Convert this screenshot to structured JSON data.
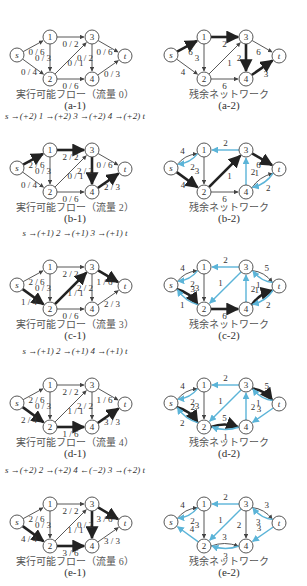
{
  "colors": {
    "normal": "#444444",
    "bold": "#222222",
    "reverse": "#5bb4d8"
  },
  "nodes": {
    "s": [
      17,
      43
    ],
    "1": [
      50,
      25
    ],
    "3": [
      92,
      25
    ],
    "t": [
      125,
      44
    ],
    "2": [
      50,
      67
    ],
    "4": [
      92,
      67
    ]
  },
  "rows": [
    {
      "top": 0,
      "left": {
        "subcaption": "(a-1)",
        "caption": "実行可能フロー（流量 0）",
        "augmenting_path": "",
        "edges": [
          {
            "from": "s",
            "to": "1",
            "label": "0 / 6",
            "style": "normal"
          },
          {
            "from": "s",
            "to": "2",
            "label": "0 / 4",
            "style": "normal"
          },
          {
            "from": "1",
            "to": "3",
            "label": "0 / 2",
            "style": "normal"
          },
          {
            "from": "1",
            "to": "2",
            "label": "0 / 3",
            "style": "normal"
          },
          {
            "from": "2",
            "to": "3",
            "label": "0 / 1",
            "style": "normal"
          },
          {
            "from": "2",
            "to": "4",
            "label": "0 / 6",
            "style": "normal"
          },
          {
            "from": "3",
            "to": "4",
            "label": "0 / 2",
            "style": "normal"
          },
          {
            "from": "3",
            "to": "t",
            "label": "0 / 6",
            "style": "normal"
          },
          {
            "from": "4",
            "to": "t",
            "label": "0 / 3",
            "style": "normal"
          }
        ]
      },
      "right": {
        "subcaption": "(a-2)",
        "caption": "残余ネットワーク",
        "edges": [
          {
            "from": "s",
            "to": "1",
            "label": "6",
            "style": "bold"
          },
          {
            "from": "s",
            "to": "2",
            "label": "4",
            "style": "normal"
          },
          {
            "from": "1",
            "to": "3",
            "label": "2",
            "style": "bold"
          },
          {
            "from": "1",
            "to": "2",
            "label": "3",
            "style": "normal"
          },
          {
            "from": "2",
            "to": "3",
            "label": "1",
            "style": "normal"
          },
          {
            "from": "2",
            "to": "4",
            "label": "6",
            "style": "normal"
          },
          {
            "from": "3",
            "to": "4",
            "label": "2",
            "style": "bold"
          },
          {
            "from": "3",
            "to": "t",
            "label": "6",
            "style": "normal"
          },
          {
            "from": "4",
            "to": "t",
            "label": "3",
            "style": "bold"
          }
        ]
      }
    },
    {
      "top": 113,
      "left": {
        "subcaption": "(b-1)",
        "caption": "実行可能フロー（流量 2）",
        "augmenting_path": "s →(+2) 1 →(+2) 3 →(+2) 4 →(+2) t",
        "edges": [
          {
            "from": "s",
            "to": "1",
            "label": "2 / 6",
            "style": "bold"
          },
          {
            "from": "s",
            "to": "2",
            "label": "0 / 4",
            "style": "normal"
          },
          {
            "from": "1",
            "to": "3",
            "label": "2 / 2",
            "style": "bold"
          },
          {
            "from": "1",
            "to": "2",
            "label": "0 / 3",
            "style": "normal"
          },
          {
            "from": "2",
            "to": "3",
            "label": "0 / 1",
            "style": "normal"
          },
          {
            "from": "2",
            "to": "4",
            "label": "0 / 6",
            "style": "normal"
          },
          {
            "from": "3",
            "to": "4",
            "label": "2 / 2",
            "style": "bold"
          },
          {
            "from": "3",
            "to": "t",
            "label": "0 / 6",
            "style": "normal"
          },
          {
            "from": "4",
            "to": "t",
            "label": "2 / 3",
            "style": "bold"
          }
        ]
      },
      "right": {
        "subcaption": "(b-2)",
        "caption": "残余ネットワーク",
        "edges": [
          {
            "from": "s",
            "to": "1",
            "label": "4",
            "style": "normal",
            "curve": -1
          },
          {
            "from": "1",
            "to": "s",
            "label": "2",
            "style": "reverse",
            "curve": -1
          },
          {
            "from": "s",
            "to": "2",
            "label": "4",
            "style": "bold"
          },
          {
            "from": "3",
            "to": "1",
            "label": "2",
            "style": "reverse"
          },
          {
            "from": "1",
            "to": "2",
            "label": "3",
            "style": "normal"
          },
          {
            "from": "2",
            "to": "3",
            "label": "1",
            "style": "bold"
          },
          {
            "from": "2",
            "to": "4",
            "label": "6",
            "style": "normal"
          },
          {
            "from": "4",
            "to": "3",
            "label": "2",
            "style": "reverse"
          },
          {
            "from": "3",
            "to": "t",
            "label": "6",
            "style": "bold"
          },
          {
            "from": "4",
            "to": "t",
            "label": "1",
            "style": "normal",
            "curve": -1
          },
          {
            "from": "t",
            "to": "4",
            "label": "2",
            "style": "reverse",
            "curve": -1
          }
        ]
      }
    },
    {
      "top": 230,
      "left": {
        "subcaption": "(c-1)",
        "caption": "実行可能フロー（流量 3）",
        "augmenting_path": "s →(+1) 2 →(+1) 3 →(+1) t",
        "edges": [
          {
            "from": "s",
            "to": "1",
            "label": "2 / 6",
            "style": "normal"
          },
          {
            "from": "s",
            "to": "2",
            "label": "1 / 4",
            "style": "bold"
          },
          {
            "from": "1",
            "to": "3",
            "label": "2 / 2",
            "style": "normal"
          },
          {
            "from": "1",
            "to": "2",
            "label": "0 / 3",
            "style": "normal"
          },
          {
            "from": "2",
            "to": "3",
            "label": "1 / 1",
            "style": "bold"
          },
          {
            "from": "2",
            "to": "4",
            "label": "0 / 6",
            "style": "normal"
          },
          {
            "from": "3",
            "to": "4",
            "label": "2 / 2",
            "style": "normal"
          },
          {
            "from": "3",
            "to": "t",
            "label": "1 / 6",
            "style": "bold"
          },
          {
            "from": "4",
            "to": "t",
            "label": "2 / 3",
            "style": "normal"
          }
        ]
      },
      "right": {
        "subcaption": "(c-2)",
        "caption": "残余ネットワーク",
        "edges": [
          {
            "from": "s",
            "to": "1",
            "label": "4",
            "style": "normal",
            "curve": -1
          },
          {
            "from": "1",
            "to": "s",
            "label": "2",
            "style": "reverse",
            "curve": -1
          },
          {
            "from": "s",
            "to": "2",
            "label": "3",
            "style": "bold",
            "curve": -1
          },
          {
            "from": "2",
            "to": "s",
            "label": "1",
            "style": "reverse",
            "curve": -1
          },
          {
            "from": "3",
            "to": "1",
            "label": "2",
            "style": "reverse"
          },
          {
            "from": "1",
            "to": "2",
            "label": "3",
            "style": "normal"
          },
          {
            "from": "3",
            "to": "2",
            "label": "1",
            "style": "reverse"
          },
          {
            "from": "2",
            "to": "4",
            "label": "6",
            "style": "bold"
          },
          {
            "from": "4",
            "to": "3",
            "label": "2",
            "style": "reverse"
          },
          {
            "from": "3",
            "to": "t",
            "label": "5",
            "style": "normal",
            "curve": -1
          },
          {
            "from": "t",
            "to": "3",
            "label": "1",
            "style": "reverse",
            "curve": -1
          },
          {
            "from": "4",
            "to": "t",
            "label": "1",
            "style": "bold",
            "curve": -1
          },
          {
            "from": "t",
            "to": "4",
            "label": "2",
            "style": "reverse",
            "curve": -1
          }
        ]
      }
    },
    {
      "top": 348,
      "left": {
        "subcaption": "(d-1)",
        "caption": "実行可能フロー（流量 4）",
        "augmenting_path": "s →(+1) 2 →(+1) 4 →(+1) t",
        "edges": [
          {
            "from": "s",
            "to": "1",
            "label": "2 / 6",
            "style": "normal"
          },
          {
            "from": "s",
            "to": "2",
            "label": "2 / 4",
            "style": "bold"
          },
          {
            "from": "1",
            "to": "3",
            "label": "2 / 2",
            "style": "normal"
          },
          {
            "from": "1",
            "to": "2",
            "label": "0 / 3",
            "style": "normal"
          },
          {
            "from": "2",
            "to": "3",
            "label": "1 / 1",
            "style": "normal"
          },
          {
            "from": "2",
            "to": "4",
            "label": "1 / 6",
            "style": "bold"
          },
          {
            "from": "3",
            "to": "4",
            "label": "2 / 2",
            "style": "normal"
          },
          {
            "from": "3",
            "to": "t",
            "label": "1 / 6",
            "style": "normal"
          },
          {
            "from": "4",
            "to": "t",
            "label": "3 / 3",
            "style": "bold"
          }
        ]
      },
      "right": {
        "subcaption": "(d-2)",
        "caption": "残余ネットワーク",
        "edges": [
          {
            "from": "s",
            "to": "1",
            "label": "4",
            "style": "normal",
            "curve": -1
          },
          {
            "from": "1",
            "to": "s",
            "label": "2",
            "style": "reverse",
            "curve": -1
          },
          {
            "from": "s",
            "to": "2",
            "label": "2",
            "style": "bold",
            "curve": -1
          },
          {
            "from": "2",
            "to": "s",
            "label": "2",
            "style": "reverse",
            "curve": -1
          },
          {
            "from": "3",
            "to": "1",
            "label": "2",
            "style": "reverse"
          },
          {
            "from": "1",
            "to": "2",
            "label": "3",
            "style": "normal"
          },
          {
            "from": "3",
            "to": "2",
            "label": "1",
            "style": "reverse"
          },
          {
            "from": "2",
            "to": "4",
            "label": "5",
            "style": "bold",
            "curve": -1
          },
          {
            "from": "4",
            "to": "2",
            "label": "1",
            "style": "reverse",
            "curve": -1
          },
          {
            "from": "4",
            "to": "3",
            "label": "2",
            "style": "reverse"
          },
          {
            "from": "3",
            "to": "t",
            "label": "5",
            "style": "bold",
            "curve": -1
          },
          {
            "from": "t",
            "to": "3",
            "label": "1",
            "style": "reverse",
            "curve": -1
          },
          {
            "from": "t",
            "to": "4",
            "label": "3",
            "style": "reverse"
          }
        ]
      }
    },
    {
      "top": 467,
      "left": {
        "subcaption": "(e-1)",
        "caption": "実行可能フロー（流量 6）",
        "augmenting_path": "s →(+2) 2 →(+2) 4 ←(−2) 3 →(+2) t",
        "edges": [
          {
            "from": "s",
            "to": "1",
            "label": "2 / 6",
            "style": "normal"
          },
          {
            "from": "s",
            "to": "2",
            "label": "4 / 4",
            "style": "bold"
          },
          {
            "from": "1",
            "to": "3",
            "label": "2 / 2",
            "style": "normal"
          },
          {
            "from": "1",
            "to": "2",
            "label": "0 / 3",
            "style": "normal"
          },
          {
            "from": "2",
            "to": "3",
            "label": "1 / 1",
            "style": "normal"
          },
          {
            "from": "2",
            "to": "4",
            "label": "3 / 6",
            "style": "bold"
          },
          {
            "from": "3",
            "to": "4",
            "label": "0 / 2",
            "style": "bold"
          },
          {
            "from": "3",
            "to": "t",
            "label": "3 / 6",
            "style": "bold"
          },
          {
            "from": "4",
            "to": "t",
            "label": "3 / 3",
            "style": "normal"
          }
        ]
      },
      "right": {
        "subcaption": "(e-2)",
        "caption": "残余ネットワーク",
        "edges": [
          {
            "from": "s",
            "to": "1",
            "label": "4",
            "style": "normal",
            "curve": -1
          },
          {
            "from": "1",
            "to": "s",
            "label": "2",
            "style": "reverse",
            "curve": -1
          },
          {
            "from": "2",
            "to": "s",
            "label": "4",
            "style": "reverse"
          },
          {
            "from": "3",
            "to": "1",
            "label": "2",
            "style": "reverse"
          },
          {
            "from": "1",
            "to": "2",
            "label": "3",
            "style": "normal"
          },
          {
            "from": "3",
            "to": "2",
            "label": "1",
            "style": "reverse"
          },
          {
            "from": "2",
            "to": "4",
            "label": "3",
            "style": "normal",
            "curve": -1
          },
          {
            "from": "4",
            "to": "2",
            "label": "3",
            "style": "reverse",
            "curve": -1
          },
          {
            "from": "3",
            "to": "4",
            "label": "2",
            "style": "normal"
          },
          {
            "from": "3",
            "to": "t",
            "label": "3",
            "style": "normal",
            "curve": -1
          },
          {
            "from": "t",
            "to": "3",
            "label": "3",
            "style": "reverse",
            "curve": -1
          },
          {
            "from": "t",
            "to": "4",
            "label": "3",
            "style": "reverse"
          }
        ]
      }
    }
  ]
}
